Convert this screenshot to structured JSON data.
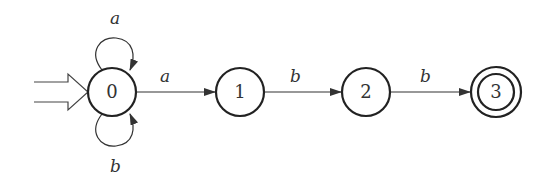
{
  "diagram": {
    "type": "finite-automaton",
    "start_state": "0",
    "accept_states": [
      "3"
    ],
    "states": [
      {
        "id": "0",
        "label": "0"
      },
      {
        "id": "1",
        "label": "1"
      },
      {
        "id": "2",
        "label": "2"
      },
      {
        "id": "3",
        "label": "3"
      }
    ],
    "transitions": [
      {
        "from": "0",
        "to": "0",
        "label": "a"
      },
      {
        "from": "0",
        "to": "0",
        "label": "b"
      },
      {
        "from": "0",
        "to": "1",
        "label": "a"
      },
      {
        "from": "1",
        "to": "2",
        "label": "b"
      },
      {
        "from": "2",
        "to": "3",
        "label": "b"
      }
    ]
  }
}
